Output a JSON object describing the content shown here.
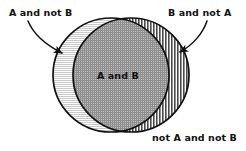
{
  "diagram": {
    "type": "venn",
    "background_color": "#ffffff",
    "outline_color": "#111111",
    "sets": [
      {
        "name": "A",
        "side": "left",
        "center_x": 111,
        "center_y": 75,
        "radius_x": 58,
        "radius_y": 57,
        "fill_pattern": "horizontal-lines",
        "fill_color": "#f0f0f0"
      },
      {
        "name": "B",
        "side": "right",
        "center_x": 131,
        "center_y": 75,
        "radius_x": 58,
        "radius_y": 57,
        "fill_pattern": "vertical-lines",
        "fill_color": "#9a9a9a"
      }
    ],
    "regions": [
      {
        "id": "a-not-b",
        "label": "A and not B",
        "pattern": "horizontal-lines",
        "label_position": "top-left",
        "has_arrow": true
      },
      {
        "id": "a-and-b",
        "label": "A and B",
        "pattern": "cross-hatch",
        "label_position": "center",
        "has_arrow": false
      },
      {
        "id": "b-not-a",
        "label": "B and not A",
        "pattern": "vertical-lines",
        "label_position": "top-right",
        "has_arrow": true
      },
      {
        "id": "not-a-not-b",
        "label": "not A and not B",
        "pattern": "none",
        "label_position": "bottom-right",
        "has_arrow": false
      }
    ]
  }
}
